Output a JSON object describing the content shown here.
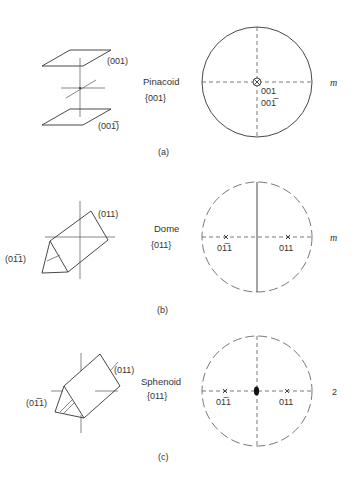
{
  "panels": [
    {
      "id": "a",
      "caption": "(a)",
      "form_name": "Pinacoid",
      "form_index": "{001}",
      "face_labels": [
        "(001)",
        "(001̅)"
      ],
      "projection": {
        "circle_style": "solid",
        "vertical_line": "dashed",
        "horizontal_line": "dashed",
        "center_symbol": "circle-with-x",
        "pole_labels": [
          "001",
          "001̅"
        ]
      },
      "symmetry_symbol": "m"
    },
    {
      "id": "b",
      "caption": "(b)",
      "form_name": "Dome",
      "form_index": "{011}",
      "face_labels": [
        "(011)",
        "(01̅1)"
      ],
      "projection": {
        "circle_style": "dashed",
        "vertical_line": "solid",
        "horizontal_line": "dashed",
        "center_symbol": "none",
        "pole_labels": [
          "01̅1",
          "011"
        ]
      },
      "symmetry_symbol": "m"
    },
    {
      "id": "c",
      "caption": "(c)",
      "form_name": "Sphenoid",
      "form_index": "{011}",
      "face_labels": [
        "(011)",
        "(01̅1)"
      ],
      "projection": {
        "circle_style": "dashed",
        "vertical_line": "dashed",
        "horizontal_line": "dashed",
        "center_symbol": "two-fold-axis",
        "pole_labels": [
          "01̅1",
          "011"
        ]
      },
      "symmetry_symbol": "2"
    }
  ]
}
